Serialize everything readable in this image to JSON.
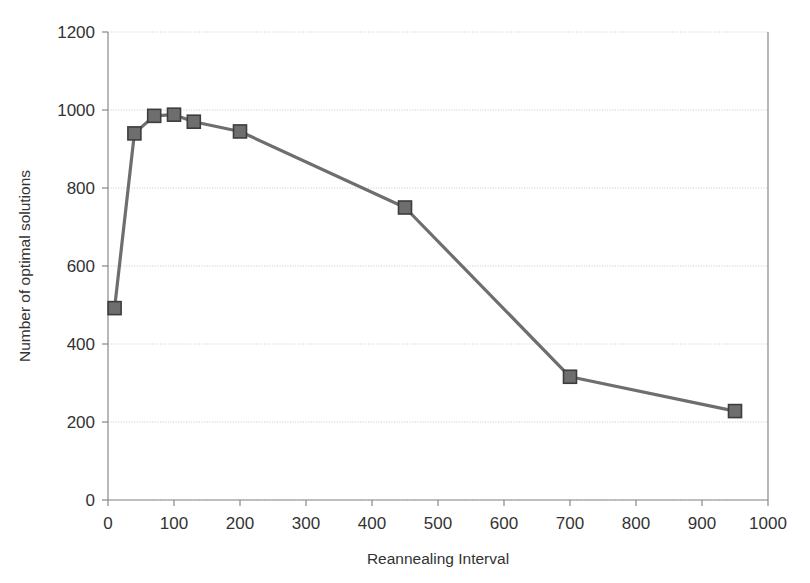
{
  "chart_data": {
    "type": "line",
    "title": "",
    "subtitle": "",
    "xlabel": "Reannealing Interval",
    "ylabel": "Number of optimal solutions",
    "xlim": [
      0,
      1000
    ],
    "ylim": [
      0,
      1200
    ],
    "xticks": [
      0,
      100,
      200,
      300,
      400,
      500,
      600,
      700,
      800,
      900,
      1000
    ],
    "xtick_labels": [
      "0",
      "100",
      "200",
      "300",
      "400",
      "500",
      "600",
      "700",
      "800",
      "900",
      "1000"
    ],
    "yticks": [
      0,
      200,
      400,
      600,
      800,
      1000,
      1200
    ],
    "ytick_labels": [
      "0",
      "200",
      "400",
      "600",
      "800",
      "1000",
      "1200"
    ],
    "grid": "horizontal",
    "legend": "none",
    "marker": "square",
    "series": [
      {
        "name": "optimal solutions",
        "color": "#6e6e6e",
        "line_color": "#6e6e6e",
        "marker_color": "#6e6e6e",
        "marker_edge_color": "#3d3d3d",
        "x": [
          10,
          40,
          70,
          100,
          130,
          200,
          450,
          700,
          950
        ],
        "y": [
          492,
          940,
          985,
          988,
          970,
          945,
          750,
          316,
          228
        ],
        "points": [
          {
            "x": 10,
            "y": 492
          },
          {
            "x": 40,
            "y": 940
          },
          {
            "x": 70,
            "y": 985
          },
          {
            "x": 100,
            "y": 988
          },
          {
            "x": 130,
            "y": 970
          },
          {
            "x": 200,
            "y": 945
          },
          {
            "x": 450,
            "y": 750
          },
          {
            "x": 700,
            "y": 316
          },
          {
            "x": 950,
            "y": 228
          }
        ]
      }
    ]
  },
  "axes": {
    "x_axis_label": "Reannealing Interval",
    "y_axis_label": "Number of optimal solutions"
  },
  "colors": {
    "series": "#6e6e6e",
    "grid": "#c8c8c8",
    "axis": "#888888",
    "text": "#333333",
    "background": "#ffffff"
  }
}
